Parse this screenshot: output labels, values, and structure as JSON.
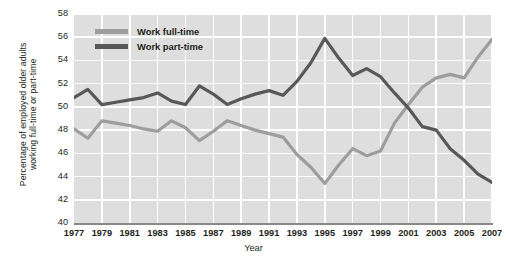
{
  "chart_data": {
    "type": "line",
    "title": "",
    "xlabel": "Year",
    "ylabel": "Percentage of employed older adults working full-time or part-time",
    "ylabel_line1": "Percentage of employed older adults",
    "ylabel_line2": "working full-time or part-time",
    "xlim": [
      1977,
      2007
    ],
    "ylim": [
      40,
      58
    ],
    "ytick_step": 2,
    "xtick_step": 2,
    "grid": true,
    "legend_position": "top-left",
    "yticks": [
      58,
      56,
      54,
      52,
      50,
      48,
      46,
      44,
      42,
      40
    ],
    "xticks": [
      1977,
      1979,
      1981,
      1983,
      1985,
      1987,
      1989,
      1991,
      1993,
      1995,
      1997,
      1999,
      2001,
      2003,
      2005,
      2007
    ],
    "x": [
      1977,
      1978,
      1979,
      1980,
      1981,
      1982,
      1983,
      1984,
      1985,
      1986,
      1987,
      1988,
      1989,
      1990,
      1991,
      1992,
      1993,
      1994,
      1995,
      1996,
      1997,
      1998,
      1999,
      2000,
      2001,
      2002,
      2003,
      2004,
      2005,
      2006,
      2007
    ],
    "series": [
      {
        "name": "Work full-time",
        "color": "#9d9d9d",
        "values": [
          48.1,
          47.3,
          48.8,
          48.6,
          48.4,
          48.1,
          47.9,
          48.8,
          48.2,
          47.1,
          47.9,
          48.8,
          48.4,
          48.0,
          47.7,
          47.4,
          45.9,
          44.8,
          43.4,
          45.0,
          46.4,
          45.8,
          46.2,
          48.6,
          50.2,
          51.7,
          52.5,
          52.8,
          52.5,
          54.3,
          55.8
        ]
      },
      {
        "name": "Work part-time",
        "color": "#585858",
        "values": [
          50.8,
          51.5,
          50.2,
          50.4,
          50.6,
          50.8,
          51.2,
          50.5,
          50.2,
          51.8,
          51.1,
          50.2,
          50.7,
          51.1,
          51.4,
          51.0,
          52.2,
          53.8,
          55.9,
          54.2,
          52.7,
          53.3,
          52.6,
          51.2,
          49.9,
          48.3,
          48.0,
          46.4,
          45.4,
          44.2,
          43.5
        ]
      }
    ]
  },
  "legend": {
    "items": [
      {
        "label": "Work full-time",
        "color": "#9d9d9d"
      },
      {
        "label": "Work part-time",
        "color": "#585858"
      }
    ]
  },
  "colors": {
    "plot_background": "#dedede",
    "grid": "#ffffff",
    "axis": "#898989",
    "text": "#231f20"
  }
}
